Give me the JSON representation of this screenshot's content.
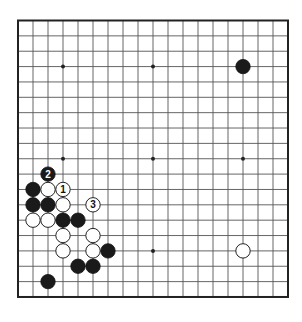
{
  "board": {
    "size": 19,
    "origin_x": 18,
    "origin_y": 20.5,
    "spacing_x": 15,
    "spacing_y": 15.36,
    "stone_radius": 7.2,
    "line_color": "#555555",
    "border_color": "#222222",
    "black_color": "#1a1a1a",
    "white_color": "#ffffff",
    "star_points": [
      [
        3,
        3
      ],
      [
        9,
        3
      ],
      [
        15,
        3
      ],
      [
        3,
        9
      ],
      [
        9,
        9
      ],
      [
        15,
        9
      ],
      [
        3,
        15
      ],
      [
        9,
        15
      ],
      [
        15,
        15
      ]
    ]
  },
  "stones": [
    {
      "color": "black",
      "col": 15,
      "row": 3,
      "label": ""
    },
    {
      "color": "black",
      "col": 2,
      "row": 10,
      "label": "2"
    },
    {
      "color": "black",
      "col": 1,
      "row": 11,
      "label": ""
    },
    {
      "color": "white",
      "col": 2,
      "row": 11,
      "label": ""
    },
    {
      "color": "white",
      "col": 3,
      "row": 11,
      "label": "1"
    },
    {
      "color": "black",
      "col": 1,
      "row": 12,
      "label": ""
    },
    {
      "color": "black",
      "col": 2,
      "row": 12,
      "label": ""
    },
    {
      "color": "white",
      "col": 3,
      "row": 12,
      "label": ""
    },
    {
      "color": "white",
      "col": 5,
      "row": 12,
      "label": "3"
    },
    {
      "color": "white",
      "col": 1,
      "row": 13,
      "label": ""
    },
    {
      "color": "white",
      "col": 2,
      "row": 13,
      "label": ""
    },
    {
      "color": "black",
      "col": 3,
      "row": 13,
      "label": ""
    },
    {
      "color": "black",
      "col": 4,
      "row": 13,
      "label": ""
    },
    {
      "color": "white",
      "col": 3,
      "row": 14,
      "label": ""
    },
    {
      "color": "white",
      "col": 5,
      "row": 14,
      "label": ""
    },
    {
      "color": "white",
      "col": 3,
      "row": 15,
      "label": ""
    },
    {
      "color": "white",
      "col": 5,
      "row": 15,
      "label": ""
    },
    {
      "color": "black",
      "col": 6,
      "row": 15,
      "label": ""
    },
    {
      "color": "white",
      "col": 15,
      "row": 15,
      "label": ""
    },
    {
      "color": "black",
      "col": 4,
      "row": 16,
      "label": ""
    },
    {
      "color": "black",
      "col": 5,
      "row": 16,
      "label": ""
    },
    {
      "color": "black",
      "col": 2,
      "row": 17,
      "label": ""
    }
  ]
}
